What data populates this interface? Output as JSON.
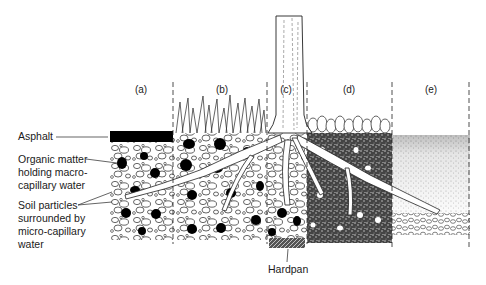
{
  "diagram": {
    "type": "soil-cross-section",
    "panels": [
      {
        "id": "a",
        "label": "(a)",
        "description": "asphalt over soil"
      },
      {
        "id": "b",
        "label": "(b)",
        "description": "grass over soil"
      },
      {
        "id": "c",
        "label": "(c)",
        "description": "tree trunk with roots, hardpan below"
      },
      {
        "id": "d",
        "label": "(d)",
        "description": "leafy groundcover over dense soil"
      },
      {
        "id": "e",
        "label": "(e)",
        "description": "fine soil over coarse gravel layer"
      }
    ],
    "callouts": {
      "asphalt": "Asphalt",
      "organic_line1": "Organic matter",
      "organic_line2": "holding macro-",
      "organic_line3": "capillary water",
      "soil_line1": "Soil particles",
      "soil_line2": "surrounded by",
      "soil_line3": "micro-capillary",
      "soil_line4": "water",
      "hardpan": "Hardpan"
    },
    "colors": {
      "ink": "#111111",
      "paper": "#ffffff",
      "stipple": "#555555"
    }
  }
}
